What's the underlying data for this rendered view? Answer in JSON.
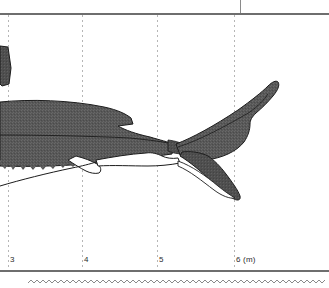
{
  "figure": {
    "axis": {
      "unit_label": "6 (m)",
      "ticks": [
        {
          "label": "3",
          "value": 3,
          "x": 10
        },
        {
          "label": "4",
          "value": 4,
          "x": 84
        },
        {
          "label": "5",
          "value": 5,
          "x": 159
        },
        {
          "label": "6 (m)",
          "value": 6,
          "x": 236
        }
      ],
      "gridline_x": [
        8,
        82,
        157,
        234
      ],
      "axis_line_y": 270,
      "top_rule_y": 13
    },
    "colors": {
      "body_fill": "#585858",
      "body_dark": "#4a4a4a",
      "outline": "#1c1c1c",
      "rule": "#6e6e6e",
      "gridline": "#b6b6b6",
      "tick_text": "#2b2b2b",
      "white_fill": "#ffffff",
      "page_background": "#ffffff"
    },
    "parts": [
      {
        "name": "dorsal-fin-fragment",
        "label": "second dorsal fin"
      },
      {
        "name": "body-trunk",
        "label": "caudal peduncle and trunk"
      },
      {
        "name": "anal-fin",
        "label": "anal fin"
      },
      {
        "name": "caudal-fin-upper-lobe",
        "label": "upper caudal lobe"
      },
      {
        "name": "caudal-fin-lower-lobe",
        "label": "lower caudal lobe"
      },
      {
        "name": "lateral-keel",
        "label": "lateral keel"
      },
      {
        "name": "belly-line",
        "label": "ventral outline"
      }
    ]
  },
  "decoration": {
    "wavy_divider": "zigzag-rule"
  }
}
